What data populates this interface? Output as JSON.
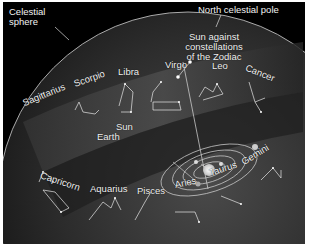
{
  "figure": {
    "labels": {
      "celestial_sphere": "Celestial\nsphere",
      "celestial_sphere_line1": "Celestial",
      "celestial_sphere_line2": "sphere",
      "north_pole": "North celestial pole",
      "sun_against_line1": "Sun against",
      "sun_against_line2": "constellations",
      "sun_against_line3": "of the Zodiac",
      "sun": "Sun",
      "earth": "Earth"
    },
    "constellations": [
      {
        "name": "Sagittarius"
      },
      {
        "name": "Scorpio"
      },
      {
        "name": "Libra"
      },
      {
        "name": "Virgo"
      },
      {
        "name": "Leo"
      },
      {
        "name": "Cancer"
      },
      {
        "name": "Gemini"
      },
      {
        "name": "Taurus"
      },
      {
        "name": "Aries"
      },
      {
        "name": "Pisces"
      },
      {
        "name": "Aquarius"
      },
      {
        "name": "Capricorn"
      }
    ],
    "colors": {
      "background": "#000000",
      "sphere": "#2a2a2a",
      "band": "#3a3a3a",
      "text": "#f2f2f2",
      "lines": "#e6e6e6"
    }
  }
}
